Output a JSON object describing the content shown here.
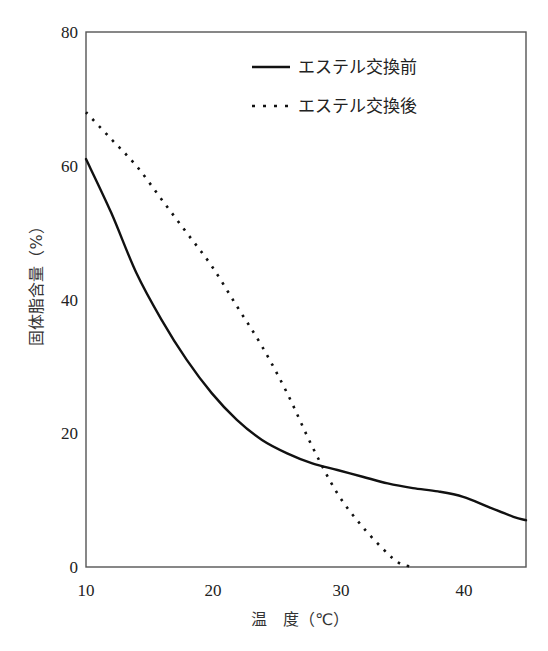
{
  "chart_data": {
    "type": "line",
    "title": "",
    "xlabel": "温　度（℃）",
    "ylabel": "固体脂含量（%）",
    "xlim": [
      10,
      45
    ],
    "ylim": [
      0,
      80
    ],
    "x_ticks": [
      10,
      20,
      30,
      40
    ],
    "y_ticks": [
      0,
      20,
      40,
      60,
      80
    ],
    "grid": false,
    "legend_position": "upper right",
    "series": [
      {
        "name": "エステル交換前",
        "style": "solid",
        "color": "#111111",
        "x": [
          10,
          12,
          14,
          16,
          18,
          20,
          22,
          24,
          26,
          28,
          30,
          32,
          34,
          36,
          38,
          40,
          42,
          44,
          45
        ],
        "y": [
          61,
          53,
          44,
          37,
          31,
          26,
          22,
          19,
          17,
          15.5,
          14.5,
          13.5,
          12.5,
          11.8,
          11.3,
          10.5,
          9,
          7.5,
          7
        ]
      },
      {
        "name": "エステル交換後",
        "style": "dotted",
        "color": "#111111",
        "x": [
          10,
          12,
          14,
          16,
          18,
          20,
          22,
          24,
          26,
          28,
          30,
          32,
          34,
          35,
          36
        ],
        "y": [
          68,
          64,
          60,
          55,
          50,
          45,
          39,
          33,
          26,
          18,
          11,
          6,
          2,
          0.5,
          0
        ]
      }
    ]
  },
  "labels": {
    "xlabel": "温　度（℃）",
    "ylabel": "固体脂含量（%）",
    "legend_before": "エステル交換前",
    "legend_after": "エステル交換後",
    "x_tick_0": "10",
    "x_tick_1": "20",
    "x_tick_2": "30",
    "x_tick_3": "40",
    "y_tick_0": "0",
    "y_tick_1": "20",
    "y_tick_2": "40",
    "y_tick_3": "60",
    "y_tick_4": "80"
  }
}
